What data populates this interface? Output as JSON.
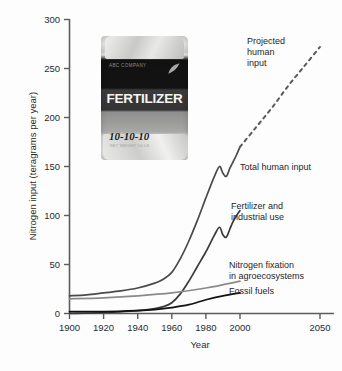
{
  "chart_data": {
    "type": "line",
    "title": "",
    "xlabel": "Year",
    "ylabel": "Nitrogen input (teragrams per year)",
    "xlim": [
      1900,
      2055
    ],
    "ylim": [
      0,
      300
    ],
    "xticks": [
      1900,
      1920,
      1940,
      1960,
      1980,
      2000,
      2050
    ],
    "yticks": [
      0,
      50,
      100,
      150,
      200,
      250,
      300
    ],
    "grid": false,
    "legend": "inline-annotations",
    "series": [
      {
        "name": "Total human input",
        "color": "#4a4a4a",
        "style": "solid",
        "x": [
          1900,
          1910,
          1920,
          1930,
          1940,
          1950,
          1955,
          1960,
          1965,
          1970,
          1975,
          1980,
          1985,
          1988,
          1990,
          1992,
          1994,
          1996,
          1998,
          2000
        ],
        "values": [
          18,
          19,
          21,
          23,
          26,
          31,
          35,
          42,
          56,
          74,
          95,
          118,
          140,
          150,
          143,
          140,
          148,
          155,
          162,
          170
        ]
      },
      {
        "name": "Projected human input",
        "color": "#5a5a5a",
        "style": "dashed",
        "x": [
          2000,
          2010,
          2020,
          2030,
          2040,
          2050
        ],
        "values": [
          170,
          190,
          210,
          232,
          252,
          272
        ]
      },
      {
        "name": "Fertilizer and industrial use",
        "color": "#3a3a3a",
        "style": "solid",
        "x": [
          1900,
          1920,
          1940,
          1950,
          1955,
          1960,
          1965,
          1970,
          1975,
          1980,
          1985,
          1988,
          1990,
          1992,
          1994,
          1996,
          1998,
          2000
        ],
        "values": [
          0,
          1,
          3,
          5,
          7,
          11,
          20,
          33,
          48,
          63,
          80,
          88,
          80,
          78,
          86,
          94,
          100,
          105
        ]
      },
      {
        "name": "Nitrogen fixation in agroecosystems",
        "color": "#8a8a8a",
        "style": "solid",
        "x": [
          1900,
          1920,
          1940,
          1960,
          1980,
          2000
        ],
        "values": [
          15,
          16,
          18,
          21,
          26,
          33
        ]
      },
      {
        "name": "Fossil fuels",
        "color": "#111111",
        "style": "solid",
        "x": [
          1900,
          1920,
          1940,
          1950,
          1960,
          1970,
          1980,
          1990,
          2000
        ],
        "values": [
          2,
          2,
          3,
          4,
          6,
          9,
          14,
          18,
          21
        ]
      }
    ],
    "annotations": [
      {
        "text_lines": [
          "Projected",
          "human",
          "input"
        ],
        "x": 2008,
        "y": 268
      },
      {
        "text_lines": [
          "Total human input"
        ],
        "x": 2004,
        "y": 160
      },
      {
        "text_lines": [
          "Fertilizer and",
          "industrial use"
        ],
        "x": 2004,
        "y": 110
      },
      {
        "text_lines": [
          "Nitrogen fixation",
          "in agroecosystems"
        ],
        "x": 2004,
        "y": 52
      },
      {
        "text_lines": [
          "Fossil fuels"
        ],
        "x": 2004,
        "y": 22
      }
    ]
  },
  "photo_inset": {
    "name": "fertilizer-bag-photograph",
    "company_text": "ABC COMPANY",
    "product_text": "FERTILIZER",
    "npk_text": "10-10-10",
    "fine_print": "NET WEIGHT 50 LB"
  },
  "axis": {
    "ylabel": "Nitrogen input (teragrams per year)",
    "xlabel": "Year",
    "ytick_labels": [
      "300",
      "250",
      "200",
      "150",
      "100",
      "50",
      "0"
    ],
    "xtick_labels": [
      "1900",
      "1920",
      "1940",
      "1960",
      "1980",
      "2000",
      "2050"
    ]
  },
  "labels": {
    "projected_human_input_l1": "Projected",
    "projected_human_input_l2": "human",
    "projected_human_input_l3": "input",
    "total_human_input": "Total human input",
    "fertilizer_industrial_l1": "Fertilizer and",
    "fertilizer_industrial_l2": "industrial use",
    "nitrogen_fixation_l1": "Nitrogen fixation",
    "nitrogen_fixation_l2": "in agroecosystems",
    "fossil_fuels": "Fossil fuels"
  },
  "colors": {
    "background": "#fdfdfd",
    "axis": "#5c5c5c",
    "total_human_input": "#4a4a4a",
    "fertilizer": "#3a3a3a",
    "nitrogen_fixation": "#8a8a8a",
    "fossil_fuels": "#111111"
  }
}
